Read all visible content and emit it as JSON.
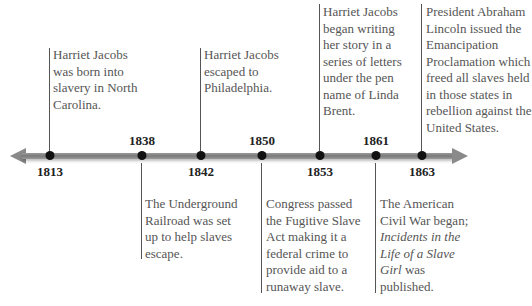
{
  "timeline": {
    "events": [
      {
        "year": "1813",
        "position": "top",
        "text": "Harriet Jacobs was born into slavery in North Carolina."
      },
      {
        "year": "1838",
        "position": "bottom",
        "text": "The Underground Railroad was set up to help slaves escape."
      },
      {
        "year": "1842",
        "position": "top",
        "text": "Harriet Jacobs escaped to Philadelphia."
      },
      {
        "year": "1850",
        "position": "bottom",
        "text": "Congress passed the Fugitive Slave Act making it a federal crime to provide aid to a runaway slave."
      },
      {
        "year": "1853",
        "position": "top",
        "text": "Harriet Jacobs began writing her story in a series of letters under the pen name of Linda Brent."
      },
      {
        "year": "1861",
        "position": "bottom",
        "text_pre": "The American Civil War began;",
        "text_italic": "Incidents in the Life of a Slave Girl",
        "text_post": "was published."
      },
      {
        "year": "1863",
        "position": "top",
        "text": "President Abraham Lincoln issued the Emancipation Proclamation which freed all slaves held in those states in rebellion against the United States."
      }
    ]
  },
  "colors": {
    "axis": "#888888",
    "dot": "#111111",
    "text": "#555555",
    "year": "#222222"
  }
}
